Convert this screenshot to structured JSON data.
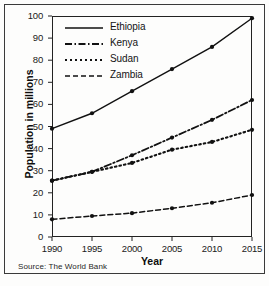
{
  "chart_data": {
    "type": "line",
    "title": "",
    "xlabel": "Year",
    "ylabel": "Population in millions",
    "x": [
      1990,
      1995,
      2000,
      2005,
      2010,
      2015
    ],
    "xticklabels": [
      "1990",
      "1995",
      "2000",
      "2005",
      "2010",
      "2015"
    ],
    "yticklabels": [
      "0",
      "10",
      "20",
      "30",
      "40",
      "50",
      "60",
      "70",
      "80",
      "90",
      "100"
    ],
    "yticks": [
      0,
      10,
      20,
      30,
      40,
      50,
      60,
      70,
      80,
      90,
      100
    ],
    "xlim": [
      1990,
      2015
    ],
    "ylim": [
      0,
      100
    ],
    "grid": false,
    "legend_position": "upper-left",
    "series": [
      {
        "name": "Ethiopia",
        "linestyle": "solid",
        "color": "#111111",
        "marker": "circle",
        "values": [
          49,
          56,
          66,
          76,
          86,
          99
        ]
      },
      {
        "name": "Kenya",
        "linestyle": "dash-dot",
        "color": "#111111",
        "marker": "circle",
        "values": [
          25.5,
          29.5,
          37,
          45,
          53,
          62
        ]
      },
      {
        "name": "Sudan",
        "linestyle": "dotted",
        "color": "#111111",
        "marker": "circle",
        "values": [
          25.5,
          29.5,
          33.5,
          39.5,
          43,
          48.5
        ]
      },
      {
        "name": "Zambia",
        "linestyle": "dashed",
        "color": "#111111",
        "marker": "circle",
        "values": [
          8,
          9.5,
          10.8,
          13,
          15.5,
          19
        ]
      }
    ],
    "annotations": [
      "Source: The World Bank"
    ]
  },
  "axes": {
    "x_title": "Year",
    "y_title": "Population in millions"
  },
  "legend": {
    "items": [
      {
        "label": "Ethiopia",
        "style": "solid-line-swatch"
      },
      {
        "label": "Kenya",
        "style": "dash-dot-line-swatch"
      },
      {
        "label": "Sudan",
        "style": "dotted-line-swatch"
      },
      {
        "label": "Zambia",
        "style": "dashed-line-swatch"
      }
    ]
  },
  "footer": {
    "source": "Source: The World Bank"
  }
}
